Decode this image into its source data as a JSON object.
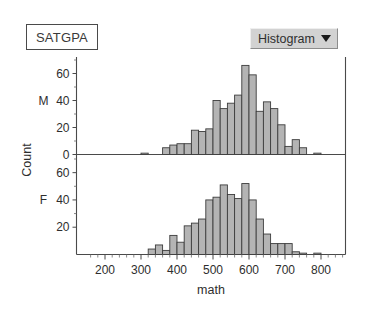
{
  "window": {
    "variable_label": "SATGPA"
  },
  "plot_menu": {
    "label": "Histogram",
    "caret_icon": "chevron-down-icon"
  },
  "colors": {
    "bar_fill": "#b4b4b4",
    "bar_stroke": "#3c3c3c",
    "axis": "#4a4a4a",
    "menu_background": "#d2d2d2",
    "text": "#2e2e2e"
  },
  "chart_data": {
    "type": "bar",
    "title": "",
    "subtitle": "",
    "xlabel": "math",
    "ylabel": "Count",
    "grid": false,
    "legend_position": "none",
    "layout": "stacked-panels",
    "xlim": [
      150,
      860
    ],
    "x_ticks": [
      200,
      300,
      400,
      500,
      600,
      700,
      800
    ],
    "x_tick_labels": [
      "200",
      "300",
      "400",
      "500",
      "600",
      "700",
      "800"
    ],
    "x_minor_step": 20,
    "bin_width": 20,
    "panels": [
      {
        "name": "M",
        "panel_label": "M",
        "ylim": [
          0,
          70
        ],
        "y_ticks": [
          0,
          20,
          40,
          60
        ],
        "y_tick_labels": [
          "0",
          "20",
          "40",
          "60"
        ],
        "bin_starts": [
          300,
          360,
          380,
          400,
          420,
          440,
          460,
          480,
          500,
          520,
          540,
          560,
          580,
          600,
          620,
          640,
          660,
          680,
          700,
          720,
          740,
          780
        ],
        "values": [
          1,
          5,
          7,
          8,
          8,
          18,
          17,
          19,
          40,
          34,
          38,
          44,
          66,
          59,
          32,
          39,
          34,
          22,
          6,
          11,
          5,
          1
        ]
      },
      {
        "name": "F",
        "panel_label": "F",
        "ylim": [
          0,
          70
        ],
        "y_ticks": [
          20,
          40,
          60
        ],
        "y_tick_labels": [
          "20",
          "40",
          "60"
        ],
        "bin_starts": [
          320,
          340,
          360,
          380,
          400,
          420,
          440,
          460,
          480,
          500,
          520,
          540,
          560,
          580,
          600,
          620,
          640,
          660,
          680,
          700,
          720,
          740,
          780
        ],
        "values": [
          4,
          7,
          3,
          14,
          9,
          21,
          23,
          26,
          40,
          42,
          51,
          44,
          41,
          52,
          40,
          26,
          15,
          8,
          8,
          8,
          2,
          1,
          1
        ]
      }
    ]
  }
}
